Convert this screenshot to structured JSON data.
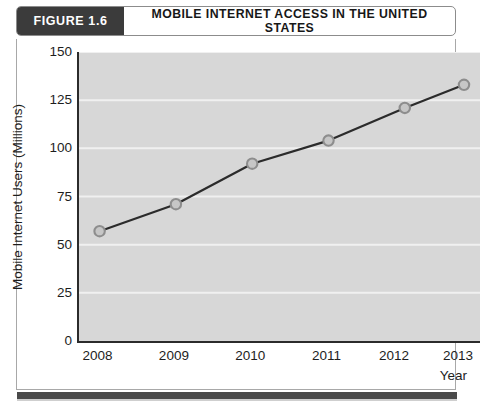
{
  "header": {
    "figure_tag": "FIGURE 1.6",
    "title": "MOBILE INTERNET ACCESS IN THE UNITED STATES",
    "tag_bg_color": "#3b3b3b",
    "tag_text_color": "#ffffff"
  },
  "chart_data": {
    "type": "line",
    "title": "MOBILE INTERNET ACCESS IN THE UNITED STATES",
    "subtitle": "",
    "xlabel": "Year",
    "ylabel": "Mobile Internet Users (Millions)",
    "categories": [
      "2008",
      "2009",
      "2010",
      "2011",
      "2012",
      "2013"
    ],
    "x": [
      2008,
      2009,
      2010,
      2011,
      2012,
      2013
    ],
    "values": [
      57,
      71,
      92,
      104,
      121,
      133
    ],
    "series": [
      {
        "name": "Mobile Internet Users",
        "values": [
          57,
          71,
          92,
          104,
          121,
          133
        ]
      }
    ],
    "ylim": [
      0,
      150
    ],
    "yticks": [
      0,
      25,
      50,
      75,
      100,
      125,
      150
    ],
    "ytick_labels": [
      "0",
      "25",
      "50",
      "75",
      "100",
      "125",
      "150"
    ],
    "xtick_labels": [
      "2008",
      "2009",
      "2010",
      "2011",
      "2012",
      "2013"
    ],
    "grid": true,
    "grid_axis": "y",
    "grid_color": "#f0f0f0",
    "legend": false,
    "legend_position": "none",
    "plot_bg_color": "#d7d7d7",
    "line_color": "#2b2b2b",
    "marker": "circle",
    "marker_face_color": "#c6c6c6",
    "marker_edge_color": "#8d8d8d",
    "annotations": []
  },
  "axes": {
    "y_title": "Mobile Internet Users (Millions)",
    "x_title": "Year"
  }
}
